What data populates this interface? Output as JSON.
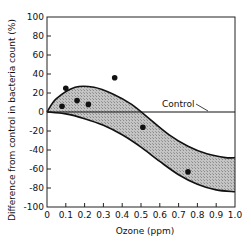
{
  "chart_data": {
    "type": "scatter",
    "title": "",
    "xlabel": "Ozone (ppm)",
    "ylabel": "Difference from control in bacteria count (%)",
    "xlim": [
      0,
      1.0
    ],
    "ylim": [
      -100,
      100
    ],
    "x_ticks": [
      "0",
      "0.1",
      "0.2",
      "0.3",
      "0.4",
      "0.5",
      "0.6",
      "0.7",
      "0.8",
      "0.9",
      "1.0"
    ],
    "y_ticks": [
      "100",
      "80",
      "60",
      "40",
      "20",
      "0",
      "-20",
      "-40",
      "-60",
      "-80",
      "-100"
    ],
    "grid": false,
    "legend": null,
    "annotations": [
      {
        "text": "Control",
        "x": 0.75,
        "y": 5,
        "points_to": "horizontal line at y=0"
      }
    ],
    "series": [
      {
        "name": "Observations",
        "x": [
          0.08,
          0.1,
          0.16,
          0.22,
          0.36,
          0.51,
          0.75
        ],
        "y": [
          6,
          25,
          12,
          8,
          36,
          -16,
          -63
        ]
      }
    ],
    "reference_line": {
      "name": "Control",
      "y": 0
    },
    "band": {
      "name": "Shaded envelope",
      "upper": {
        "x": [
          0.0,
          0.05,
          0.15,
          0.25,
          0.35,
          0.45,
          0.55,
          0.65,
          0.75,
          0.85,
          0.95,
          1.0
        ],
        "y": [
          0,
          14,
          26,
          26,
          19,
          8,
          -8,
          -24,
          -36,
          -44,
          -48,
          -48
        ]
      },
      "lower": {
        "x": [
          0.0,
          0.1,
          0.2,
          0.3,
          0.4,
          0.5,
          0.6,
          0.7,
          0.8,
          0.9,
          1.0
        ],
        "y": [
          0,
          -2,
          -7,
          -14,
          -24,
          -37,
          -52,
          -66,
          -76,
          -82,
          -84
        ]
      }
    }
  }
}
